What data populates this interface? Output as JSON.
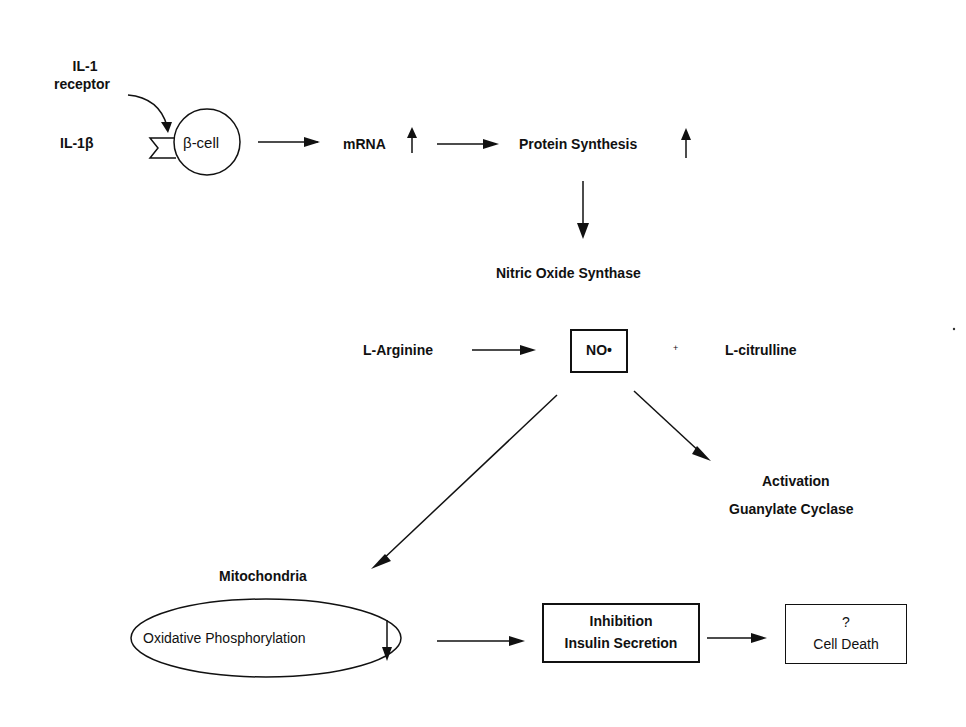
{
  "diagram": {
    "nodes": {
      "il1_receptor": "IL-1\nreceptor",
      "il1_receptor_line1": "IL-1",
      "il1_receptor_line2": "receptor",
      "il1b": "IL-1β",
      "beta_cell": "β-cell",
      "mrna": "mRNA",
      "protein_synthesis": "Protein Synthesis",
      "nos": "Nitric Oxide Synthase",
      "l_arginine": "L-Arginine",
      "no": "NO•",
      "plus": "+",
      "l_citrulline": "L-citrulline",
      "activation": "Activation",
      "guanylate_cyclase": "Guanylate Cyclase",
      "mitochondria": "Mitochondria",
      "oxphos": "Oxidative Phosphorylation",
      "inhibition": "Inhibition",
      "insulin_secretion": "Insulin Secretion",
      "question": "?",
      "cell_death": "Cell Death"
    },
    "edges": [
      {
        "from": "il1_receptor",
        "to": "beta_cell",
        "style": "curved"
      },
      {
        "from": "beta_cell",
        "to": "mrna"
      },
      {
        "from": "mrna",
        "to": "protein_synthesis"
      },
      {
        "from": "protein_synthesis",
        "to": "nos"
      },
      {
        "from": "l_arginine",
        "to": "no"
      },
      {
        "from": "no",
        "to": "guanylate_cyclase"
      },
      {
        "from": "no",
        "to": "mitochondria"
      },
      {
        "from": "oxphos",
        "to": "insulin_secretion"
      },
      {
        "from": "insulin_secretion",
        "to": "cell_death"
      }
    ],
    "indicators": {
      "mrna": "up",
      "protein_synthesis": "up",
      "oxphos": "down"
    }
  }
}
